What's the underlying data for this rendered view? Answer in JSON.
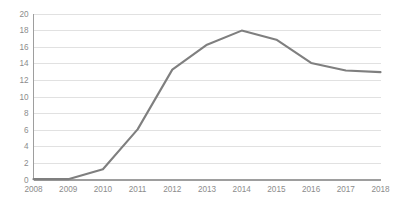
{
  "chart_data": {
    "type": "line",
    "title": "",
    "subtitle": "",
    "xlabel": "",
    "ylabel": "",
    "categories": [
      "2008",
      "2009",
      "2010",
      "2011",
      "2012",
      "2013",
      "2014",
      "2015",
      "2016",
      "2017",
      "2018"
    ],
    "values": [
      0.1,
      0.1,
      1.3,
      6.1,
      13.3,
      16.3,
      18.0,
      16.9,
      14.1,
      13.2,
      13.0
    ],
    "series": [
      {
        "name": "",
        "values": [
          0.1,
          0.1,
          1.3,
          6.1,
          13.3,
          16.3,
          18.0,
          16.9,
          14.1,
          13.2,
          13.0
        ],
        "color": "#7f7f7f"
      }
    ],
    "ylim": [
      0,
      20
    ],
    "ytick_values": [
      0,
      2,
      4,
      6,
      8,
      10,
      12,
      14,
      16,
      18,
      20
    ],
    "ytick_labels": [
      "0",
      "2",
      "4",
      "6",
      "8",
      "10",
      "12",
      "14",
      "16",
      "18",
      "20"
    ],
    "xtick_labels": [
      "2008",
      "2009",
      "2010",
      "2011",
      "2012",
      "2013",
      "2014",
      "2015",
      "2016",
      "2017",
      "2018"
    ],
    "grid": {
      "horizontal": true,
      "vertical": false,
      "color": "#d9d9d9"
    },
    "legend": {
      "visible": false,
      "position": "none",
      "entries": []
    },
    "annotations": [],
    "colors": {
      "line": "#7f7f7f",
      "gridline": "#d9d9d9",
      "axis": "#9e9e9e",
      "tick_label": "#8c8c8c",
      "background": "#ffffff"
    }
  }
}
